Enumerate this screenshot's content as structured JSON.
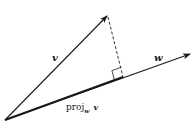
{
  "diagram": {
    "colors": {
      "stroke": "#1a1a1a",
      "background": "#ffffff"
    },
    "points": {
      "origin": [
        5,
        120
      ],
      "v_tip": [
        107,
        16
      ],
      "w_tip": [
        190,
        54
      ],
      "foot": [
        123,
        77
      ]
    },
    "labels": {
      "v": "v",
      "w": "w",
      "proj_main": "proj",
      "proj_sub": "w",
      "proj_arg": "v"
    },
    "elements": [
      {
        "id": "vector-v",
        "type": "arrow",
        "from": "origin",
        "to": "v_tip",
        "label": "v"
      },
      {
        "id": "vector-w",
        "type": "arrow",
        "from": "origin",
        "to": "w_tip",
        "label": "w"
      },
      {
        "id": "perpendicular",
        "type": "dashed-line",
        "from": "v_tip",
        "to": "foot"
      },
      {
        "id": "right-angle-marker",
        "type": "square",
        "at": "foot"
      },
      {
        "id": "projection-label",
        "type": "text",
        "text": "proj_w v"
      }
    ]
  }
}
